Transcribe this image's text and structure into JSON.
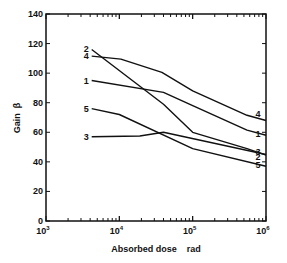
{
  "chart_data": {
    "type": "line",
    "title": "",
    "xlabel": "Absorbed dose    rad",
    "ylabel": "Gain  β",
    "xscale": "log",
    "xlim": [
      1000,
      1000000
    ],
    "ylim": [
      0,
      140
    ],
    "grid": false,
    "legend": "inline labels at curve ends",
    "x_ticks": [
      {
        "base": "10",
        "exp": "3",
        "value": 1000
      },
      {
        "base": "10",
        "exp": "4",
        "value": 10000
      },
      {
        "base": "10",
        "exp": "5",
        "value": 100000
      },
      {
        "base": "10",
        "exp": "6",
        "value": 1000000
      }
    ],
    "y_ticks": [
      0,
      20,
      40,
      60,
      80,
      100,
      120,
      140
    ],
    "series": [
      {
        "name": "1",
        "x": [
          4200,
          40000,
          100000,
          550000,
          1000000
        ],
        "y": [
          95,
          87,
          78,
          61.5,
          58
        ]
      },
      {
        "name": "2",
        "x": [
          4200,
          40000,
          100000,
          550000,
          1000000
        ],
        "y": [
          116,
          79,
          60,
          49,
          44.5
        ]
      },
      {
        "name": "3",
        "x": [
          4200,
          19000,
          40000,
          1000000
        ],
        "y": [
          57,
          57.5,
          60,
          45
        ]
      },
      {
        "name": "4",
        "x": [
          4200,
          10500,
          38000,
          100000,
          550000,
          1000000
        ],
        "y": [
          111.5,
          109.5,
          100.5,
          88,
          71.5,
          68
        ]
      },
      {
        "name": "5",
        "x": [
          4200,
          10000,
          100000,
          1000000
        ],
        "y": [
          76,
          72,
          49,
          37
        ]
      }
    ]
  }
}
